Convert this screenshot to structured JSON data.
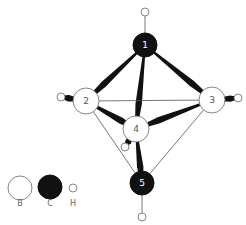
{
  "diagram": {
    "type": "molecular-structure",
    "colors": {
      "bond": "#111111",
      "thin_bond": "#555555",
      "boron_fill": "#ffffff",
      "boron_stroke": "#777777",
      "carbon_fill": "#111111",
      "hydrogen_fill": "#ffffff",
      "hydrogen_stroke": "#777777"
    },
    "atoms": [
      {
        "id": "1",
        "label": "1",
        "element": "C",
        "x": 145,
        "y": 45,
        "r": 12
      },
      {
        "id": "2",
        "label": "2",
        "element": "B",
        "x": 86,
        "y": 101,
        "r": 13
      },
      {
        "id": "3",
        "label": "3",
        "element": "B",
        "x": 212,
        "y": 100,
        "r": 13
      },
      {
        "id": "4",
        "label": "4",
        "element": "B",
        "x": 136,
        "y": 129,
        "r": 13
      },
      {
        "id": "5",
        "label": "5",
        "element": "C",
        "x": 142,
        "y": 183,
        "r": 12
      },
      {
        "id": "H1",
        "label": "",
        "element": "H",
        "x": 145,
        "y": 12,
        "r": 4
      },
      {
        "id": "H2",
        "label": "",
        "element": "H",
        "x": 61,
        "y": 97,
        "r": 4
      },
      {
        "id": "H3",
        "label": "",
        "element": "H",
        "x": 238,
        "y": 98,
        "r": 4
      },
      {
        "id": "H4",
        "label": "",
        "element": "H",
        "x": 125,
        "y": 147,
        "r": 4
      },
      {
        "id": "H5",
        "label": "",
        "element": "H",
        "x": 142,
        "y": 217,
        "r": 4
      }
    ],
    "bonds": [
      {
        "from": "1",
        "to": "2",
        "style": "wedge"
      },
      {
        "from": "1",
        "to": "3",
        "style": "wedge"
      },
      {
        "from": "1",
        "to": "4",
        "style": "wedge"
      },
      {
        "from": "2",
        "to": "3",
        "style": "thin"
      },
      {
        "from": "2",
        "to": "4",
        "style": "wedge"
      },
      {
        "from": "3",
        "to": "4",
        "style": "wedge"
      },
      {
        "from": "2",
        "to": "5",
        "style": "thin"
      },
      {
        "from": "3",
        "to": "5",
        "style": "thin"
      },
      {
        "from": "4",
        "to": "5",
        "style": "wedge"
      },
      {
        "from": "1",
        "to": "H1",
        "style": "thin"
      },
      {
        "from": "2",
        "to": "H2",
        "style": "wedge"
      },
      {
        "from": "3",
        "to": "H3",
        "style": "wedge"
      },
      {
        "from": "4",
        "to": "H4",
        "style": "wedge"
      },
      {
        "from": "5",
        "to": "H5",
        "style": "thin"
      }
    ]
  },
  "legend": {
    "items": [
      {
        "label": "B",
        "element": "B",
        "x": 20,
        "y": 188,
        "r": 12
      },
      {
        "label": "C",
        "element": "C",
        "x": 50,
        "y": 187,
        "r": 12
      },
      {
        "label": "H",
        "element": "H",
        "x": 73,
        "y": 188,
        "r": 4
      }
    ],
    "label_y": 206
  }
}
